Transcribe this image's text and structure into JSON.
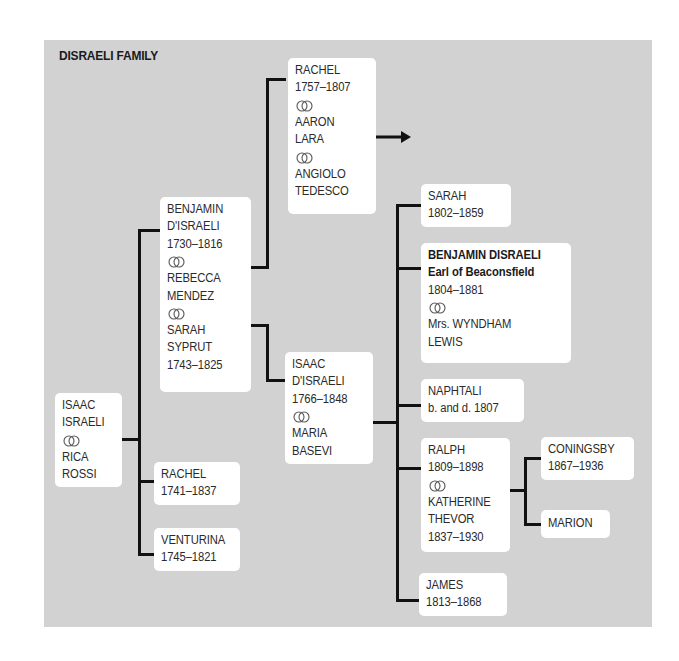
{
  "title": "DISRAELI FAMILY",
  "marriage_symbol": "interlocking-rings-icon",
  "colors": {
    "panel_bg": "#d2d2d2",
    "box_bg": "#ffffff",
    "line": "#111111",
    "text": "#2a2a2a"
  },
  "people": {
    "isaac_israeli": {
      "lines": [
        "ISAAC",
        "ISRAELI"
      ],
      "spouse": [
        "RICA",
        "ROSSI"
      ]
    },
    "benjamin_disraeli_sr": {
      "lines": [
        "BENJAMIN",
        "D'ISRAELI",
        "1730–1816"
      ],
      "spouse1": [
        "REBECCA",
        "MENDEZ"
      ],
      "spouse2": [
        "SARAH",
        "SYPRUT",
        "1743–1825"
      ]
    },
    "rachel_1741": {
      "lines": [
        "RACHEL",
        "1741–1837"
      ]
    },
    "venturina": {
      "lines": [
        "VENTURINA",
        "1745–1821"
      ]
    },
    "rachel_1757": {
      "lines": [
        "RACHEL",
        "1757–1807"
      ],
      "spouse1": [
        "AARON",
        "LARA"
      ],
      "spouse2": [
        "ANGIOLO",
        "TEDESCO"
      ]
    },
    "isaac_disraeli": {
      "lines": [
        "ISAAC",
        "D'ISRAELI",
        "1766–1848"
      ],
      "spouse": [
        "MARIA",
        "BASEVI"
      ]
    },
    "sarah": {
      "lines": [
        "SARAH",
        "1802–1859"
      ]
    },
    "benjamin_earl": {
      "bold_lines": [
        "BENJAMIN DISRAELI",
        "Earl of Beaconsfield"
      ],
      "lines": [
        "1804–1881"
      ],
      "spouse": [
        "Mrs. WYNDHAM",
        "LEWIS"
      ]
    },
    "naphtali": {
      "lines": [
        "NAPHTALI",
        "b. and d. 1807"
      ]
    },
    "ralph": {
      "lines": [
        "RALPH",
        "1809–1898"
      ],
      "spouse": [
        "KATHERINE",
        "THEVOR",
        "1837–1930"
      ]
    },
    "james": {
      "lines": [
        "JAMES",
        "1813–1868"
      ]
    },
    "coningsby": {
      "lines": [
        "CONINGSBY",
        "1867–1936"
      ]
    },
    "marion": {
      "lines": [
        "MARION"
      ]
    }
  }
}
